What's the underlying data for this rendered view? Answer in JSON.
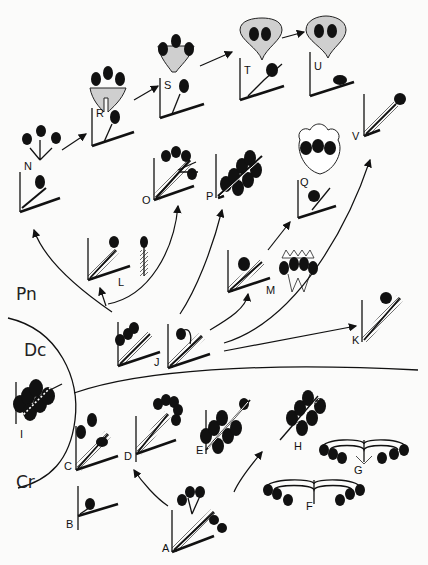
{
  "figure": {
    "type": "evolutionary-diagram",
    "groups": [
      {
        "id": "pn",
        "label": "Pn"
      },
      {
        "id": "dc",
        "label": "Dc"
      },
      {
        "id": "cr",
        "label": "Cr"
      }
    ],
    "panels": [
      {
        "id": "A",
        "label": "A"
      },
      {
        "id": "B",
        "label": "B"
      },
      {
        "id": "C",
        "label": "C"
      },
      {
        "id": "D",
        "label": "D"
      },
      {
        "id": "E",
        "label": "E"
      },
      {
        "id": "F",
        "label": "F"
      },
      {
        "id": "G",
        "label": "G"
      },
      {
        "id": "H",
        "label": "H"
      },
      {
        "id": "I",
        "label": "I"
      },
      {
        "id": "J",
        "label": "J"
      },
      {
        "id": "K",
        "label": "K"
      },
      {
        "id": "L",
        "label": "L"
      },
      {
        "id": "M",
        "label": "M"
      },
      {
        "id": "N",
        "label": "N"
      },
      {
        "id": "O",
        "label": "O"
      },
      {
        "id": "P",
        "label": "P"
      },
      {
        "id": "Q",
        "label": "Q"
      },
      {
        "id": "R",
        "label": "R"
      },
      {
        "id": "S",
        "label": "S"
      },
      {
        "id": "T",
        "label": "T"
      },
      {
        "id": "U",
        "label": "U"
      },
      {
        "id": "V",
        "label": "V"
      }
    ],
    "arrows": [
      {
        "from": "N",
        "to": "R"
      },
      {
        "from": "R",
        "to": "S"
      },
      {
        "from": "S",
        "to": "T"
      },
      {
        "from": "T",
        "to": "U"
      },
      {
        "from": "J",
        "to": "N"
      },
      {
        "from": "J",
        "to": "L"
      },
      {
        "from": "J",
        "to": "O"
      },
      {
        "from": "J",
        "to": "P"
      },
      {
        "from": "J",
        "to": "M"
      },
      {
        "from": "M",
        "to": "Q"
      },
      {
        "from": "J",
        "to": "V"
      },
      {
        "from": "J",
        "to": "K"
      },
      {
        "from": "A",
        "to": "D"
      },
      {
        "from": "A",
        "to": "H"
      }
    ]
  }
}
